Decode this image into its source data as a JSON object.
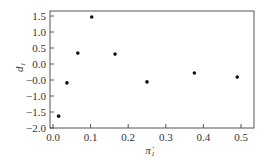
{
  "chart_data": {
    "type": "scatter",
    "title": "",
    "xlabel": "π̇₁",
    "ylabel": "d₁",
    "xlim": [
      0.0,
      0.54
    ],
    "ylim": [
      -2.0,
      1.75
    ],
    "xticks": [
      "0.0",
      "0.1",
      "0.2",
      "0.3",
      "0.4",
      "0.5"
    ],
    "yticks": [
      "1.5",
      "1.0",
      "0.5",
      "0.0",
      "-0.0",
      "-1.0",
      "-1.5",
      "-2.0"
    ],
    "grid": false,
    "legend": null,
    "series": [
      {
        "name": "d1",
        "x": [
          0.015,
          0.037,
          0.066,
          0.103,
          0.165,
          0.25,
          0.376,
          0.49
        ],
        "y": [
          -1.63,
          -0.59,
          0.34,
          1.47,
          0.31,
          -0.56,
          -0.28,
          -0.41
        ]
      }
    ]
  }
}
